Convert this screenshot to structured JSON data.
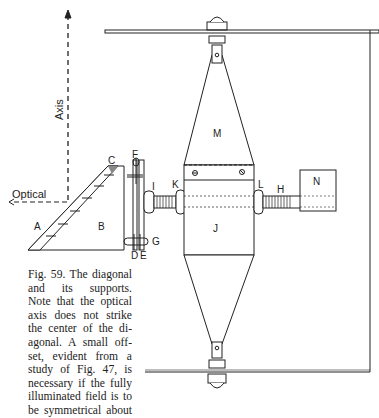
{
  "figure": {
    "number": "Fig. 59.",
    "caption_lines": [
      "Fig. 59. The diagonal",
      "and  its  supports.",
      "Note that the optical",
      "axis does not strike",
      "the center of the di-",
      "agonal.  A small off-",
      "set, evident from a",
      "study of Fig. 47, is",
      "necessary if the fully",
      "illuminated field is to",
      "be symmetrical about"
    ],
    "axis_labels": {
      "vertical": "Axis",
      "horizontal": "Optical"
    },
    "part_labels": {
      "A": "A",
      "B": "B",
      "C": "C",
      "D": "D",
      "E": "E",
      "F": "F",
      "G": "G",
      "H": "H",
      "I": "I",
      "J": "J",
      "K": "K",
      "L": "L",
      "M": "M",
      "N": "N"
    }
  },
  "colors": {
    "ink": "#222222",
    "paper": "#ffffff"
  }
}
